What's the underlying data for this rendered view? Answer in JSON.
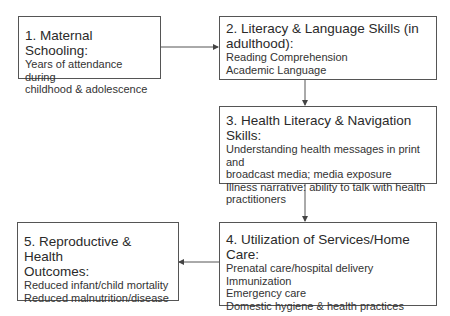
{
  "diagram": {
    "nodes": [
      {
        "id": 1,
        "title": "1. Maternal Schooling:",
        "lines": [
          "Years of attendance during",
          "childhood & adolescence"
        ]
      },
      {
        "id": 2,
        "title_lines": [
          "2. Literacy & Language Skills (in",
          "adulthood):"
        ],
        "lines": [
          "Reading Comprehension",
          "Academic Language"
        ]
      },
      {
        "id": 3,
        "title": "3. Health Literacy & Navigation Skills:",
        "lines": [
          "Understanding health messages in print and",
          "broadcast media; media exposure",
          "Illness narrative: ability to talk with health",
          "practitioners"
        ]
      },
      {
        "id": 4,
        "title": "4. Utilization of Services/Home Care:",
        "lines": [
          "Prenatal care/hospital delivery",
          "Immunization",
          "Emergency care",
          "Domestic hygiene & health practices"
        ]
      },
      {
        "id": 5,
        "title_lines": [
          "5. Reproductive & Health",
          "Outcomes:"
        ],
        "lines": [
          "Reduced infant/child mortality",
          "Reduced malnutrition/disease"
        ]
      }
    ],
    "edges": [
      {
        "from": 1,
        "to": 2,
        "direction": "right"
      },
      {
        "from": 2,
        "to": 3,
        "direction": "down"
      },
      {
        "from": 3,
        "to": 4,
        "direction": "down"
      },
      {
        "from": 4,
        "to": 5,
        "direction": "left"
      }
    ],
    "colors": {
      "border": "#555555",
      "arrow": "#444444",
      "text": "#2a2a2a"
    }
  }
}
